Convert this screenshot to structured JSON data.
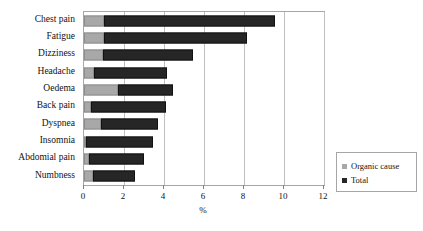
{
  "chart_data": {
    "type": "bar",
    "orientation": "horizontal",
    "stacked": true,
    "title": "",
    "subtitle": "",
    "xlabel": "%",
    "ylabel": "",
    "xlim": [
      0,
      12
    ],
    "xticks": [
      0,
      2,
      4,
      6,
      8,
      10,
      12
    ],
    "xticklabels": [
      "0",
      "2",
      "4",
      "6",
      "8",
      "10",
      "12"
    ],
    "grid": "vertical",
    "legend_position": "bottom-right",
    "categories": [
      "Chest pain",
      "Fatigue",
      "Dizziness",
      "Headache",
      "Oedema",
      "Back pain",
      "Dyspnea",
      "Abdomial pain",
      "Insomnia",
      "Numbness"
    ],
    "series": [
      {
        "name": "Organic cause",
        "color": "#a8a8a8",
        "values": [
          1.0,
          1.0,
          0.95,
          0.5,
          1.7,
          0.35,
          0.85,
          0.1,
          0.25,
          0.45
        ]
      },
      {
        "name": "Total",
        "color": "#262626",
        "values": [
          9.55,
          8.15,
          5.45,
          4.15,
          4.45,
          4.1,
          3.7,
          3.45,
          3.0,
          2.55
        ]
      }
    ],
    "rows": [
      {
        "category": "Chest pain",
        "organic_cause": 1.0,
        "total": 9.55
      },
      {
        "category": "Fatigue",
        "organic_cause": 1.0,
        "total": 8.15
      },
      {
        "category": "Dizziness",
        "organic_cause": 0.95,
        "total": 5.45
      },
      {
        "category": "Headache",
        "organic_cause": 0.5,
        "total": 4.15
      },
      {
        "category": "Oedema",
        "organic_cause": 1.7,
        "total": 4.45
      },
      {
        "category": "Back pain",
        "organic_cause": 0.35,
        "total": 4.1
      },
      {
        "category": "Dyspnea",
        "organic_cause": 0.85,
        "total": 3.7
      },
      {
        "category": "Insomnia",
        "organic_cause": 0.1,
        "total": 3.45
      },
      {
        "category": "Abdomial pain",
        "organic_cause": 0.25,
        "total": 3.0
      },
      {
        "category": "Numbness",
        "organic_cause": 0.45,
        "total": 2.55
      }
    ],
    "legend": [
      {
        "label": "Organic cause",
        "color": "#a8a8a8"
      },
      {
        "label": "Total",
        "color": "#262626"
      }
    ]
  },
  "axis": {
    "x_title": "%"
  },
  "colors": {
    "organic": "#a8a8a8",
    "total": "#262626",
    "gridline": "#bfbfbf",
    "border": "#a6a6a6",
    "text": "#111111"
  }
}
